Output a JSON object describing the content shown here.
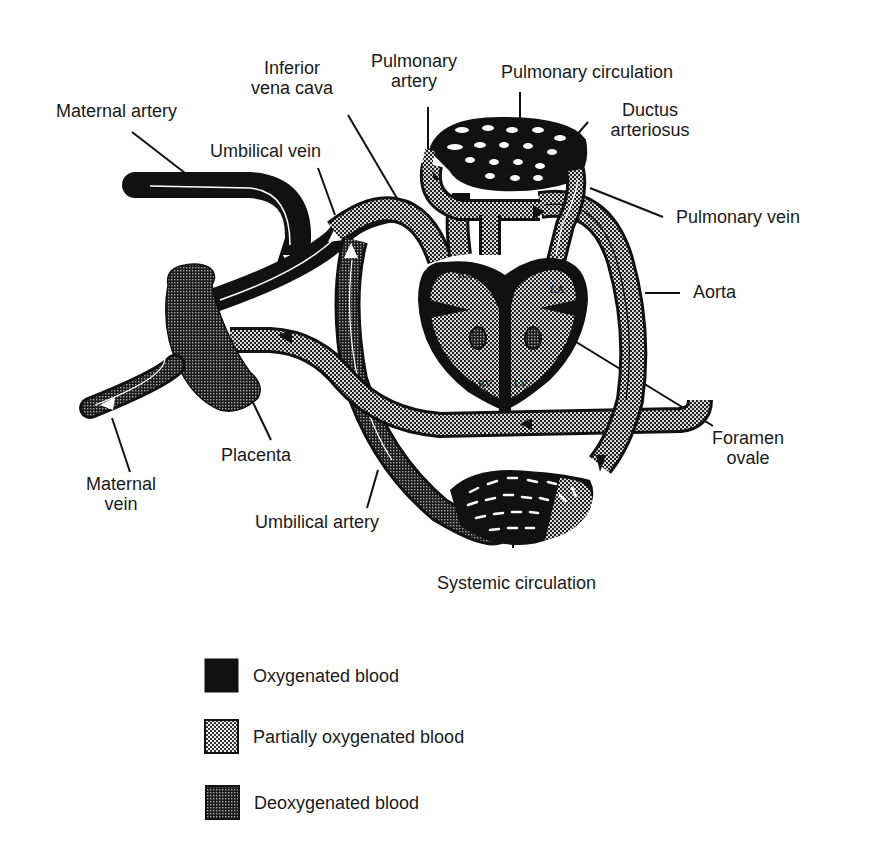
{
  "labels": {
    "maternal_artery": "Maternal artery",
    "umbilical_vein": "Umbilical vein",
    "inferior_vena_cava_l1": "Inferior",
    "inferior_vena_cava_l2": "vena cava",
    "pulmonary_artery_l1": "Pulmonary",
    "pulmonary_artery_l2": "artery",
    "pulmonary_circulation": "Pulmonary circulation",
    "ductus_arteriosus_l1": "Ductus",
    "ductus_arteriosus_l2": "arteriosus",
    "pulmonary_vein": "Pulmonary vein",
    "aorta": "Aorta",
    "foramen_ovale_l1": "Foramen",
    "foramen_ovale_l2": "ovale",
    "placenta": "Placenta",
    "maternal_vein_l1": "Maternal",
    "maternal_vein_l2": "vein",
    "umbilical_artery": "Umbilical artery",
    "systemic_circulation": "Systemic circulation"
  },
  "heart_chambers": {
    "ra": "RA",
    "la": "LA",
    "rv": "RV",
    "lv": "LV"
  },
  "legend": [
    {
      "label": "Oxygenated blood",
      "pattern": "solid-black"
    },
    {
      "label": "Partially oxygenated blood",
      "pattern": "light-stipple"
    },
    {
      "label": "Deoxygenated blood",
      "pattern": "dark-stipple"
    }
  ],
  "colors": {
    "oxygenated": "#111111",
    "partial": "#9a9a9a",
    "deoxygenated": "#555555",
    "outline": "#111111",
    "background": "#ffffff"
  }
}
